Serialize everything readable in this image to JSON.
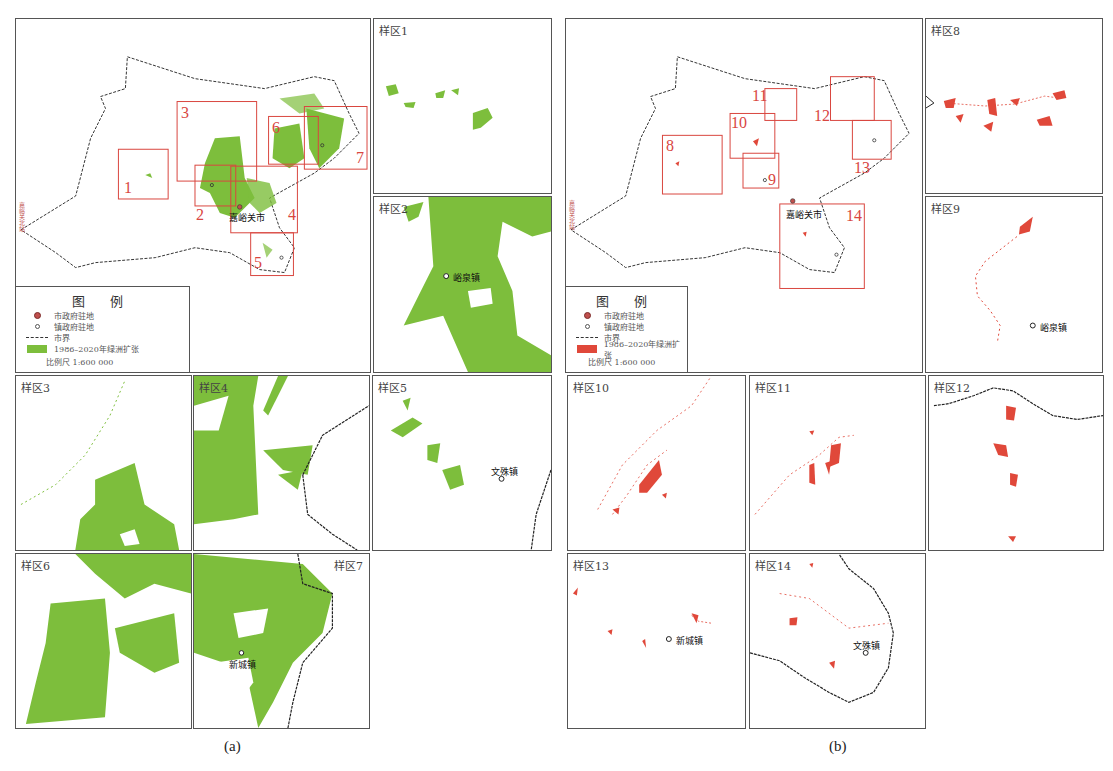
{
  "figure": {
    "captions": {
      "a": "(a)",
      "b": "(b)"
    },
    "colors": {
      "green": "#7dbe3c",
      "red": "#e0483a",
      "box_red": "#d9463f",
      "border": "#333333"
    }
  },
  "panel_a": {
    "main_map": {
      "city_label": "嘉峪关市",
      "edge_label": "嘉峪关北站",
      "boxes": [
        "1",
        "2",
        "3",
        "4",
        "5",
        "6",
        "7"
      ],
      "legend": {
        "title": "图 例",
        "items": [
          {
            "symbol": "city-dot",
            "label": "市政府驻地"
          },
          {
            "symbol": "town-dot",
            "label": "镇政府驻地"
          },
          {
            "symbol": "boundary-line",
            "label": "市界"
          },
          {
            "symbol": "green-swatch",
            "label": "1986–2020年绿洲扩张"
          }
        ],
        "scale": "比例尺 1:600 000"
      }
    },
    "samples": [
      {
        "label": "样区1"
      },
      {
        "label": "样区2",
        "town": "峪泉镇"
      },
      {
        "label": "样区3"
      },
      {
        "label": "样区4"
      },
      {
        "label": "样区5",
        "town": "文殊镇"
      },
      {
        "label": "样区6"
      },
      {
        "label": "样区7",
        "town": "新城镇"
      }
    ]
  },
  "panel_b": {
    "main_map": {
      "city_label": "嘉峪关市",
      "edge_label": "嘉峪关北站",
      "boxes": [
        "8",
        "9",
        "10",
        "11",
        "12",
        "13",
        "14"
      ],
      "legend": {
        "title": "图 例",
        "items": [
          {
            "symbol": "city-dot",
            "label": "市政府驻地"
          },
          {
            "symbol": "town-dot",
            "label": "镇政府驻地"
          },
          {
            "symbol": "boundary-line",
            "label": "市界"
          },
          {
            "symbol": "red-swatch",
            "label": "1986–2020年绿洲扩张"
          }
        ],
        "scale": "比例尺 1:600 000"
      }
    },
    "samples": [
      {
        "label": "样区8"
      },
      {
        "label": "样区9",
        "town": "峪泉镇"
      },
      {
        "label": "样区10"
      },
      {
        "label": "样区11"
      },
      {
        "label": "样区12"
      },
      {
        "label": "样区13",
        "town": "新城镇"
      },
      {
        "label": "样区14",
        "town": "文殊镇"
      }
    ]
  }
}
